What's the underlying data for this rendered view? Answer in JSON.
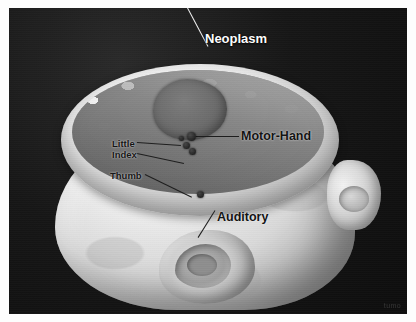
{
  "figure": {
    "kind": "3d-rendered-medical-visualization",
    "background_color": "#121212",
    "plate_border_color": "#ffffff"
  },
  "anatomy": {
    "scalp_label": "scalp-surface",
    "ear_label": "ear",
    "craniotomy_label": "craniotomy-rim",
    "cortex_label": "cortical-surface",
    "neoplasm_color": "#6d6d6d",
    "cortex_color": "#e0e0e0",
    "scalp_color": "#d9d9d9"
  },
  "annotations": [
    {
      "id": "neoplasm",
      "label": "Neoplasm",
      "style": "white",
      "label_x": 196,
      "label_y": 24,
      "leader": {
        "x": 199,
        "y": 38,
        "length": 62,
        "angle": 118
      },
      "marker": null
    },
    {
      "id": "motor-hand",
      "label": "Motor-Hand",
      "style": "black",
      "label_x": 232,
      "label_y": 122,
      "leader": {
        "x": 186,
        "y": 128,
        "length": 44,
        "angle": 0
      },
      "marker": {
        "x": 178,
        "y": 124,
        "size": "lg"
      }
    },
    {
      "id": "little",
      "label": "Little",
      "style": "small",
      "label_x": 103,
      "label_y": 131,
      "leader": {
        "x": 128,
        "y": 134,
        "length": 44,
        "angle": -4
      },
      "marker": {
        "x": 170,
        "y": 128,
        "size": "sm"
      }
    },
    {
      "id": "index",
      "label": "Index",
      "style": "small",
      "label_x": 103,
      "label_y": 142,
      "leader": {
        "x": 128,
        "y": 145,
        "length": 48,
        "angle": -12
      },
      "marker": {
        "x": 174,
        "y": 134,
        "size": "md"
      }
    },
    {
      "id": "thumb",
      "label": "Thumb",
      "style": "small",
      "label_x": 101,
      "label_y": 163,
      "leader": {
        "x": 136,
        "y": 166,
        "length": 52,
        "angle": -26
      },
      "marker": {
        "x": 180,
        "y": 140,
        "size": "md"
      }
    },
    {
      "id": "auditory",
      "label": "Auditory",
      "style": "black",
      "label_x": 208,
      "label_y": 203,
      "leader": {
        "x": 206,
        "y": 202,
        "length": 32,
        "angle": -122
      },
      "marker": {
        "x": 188,
        "y": 183,
        "size": "md"
      }
    }
  ],
  "watermark": {
    "text": "tumo"
  }
}
